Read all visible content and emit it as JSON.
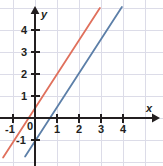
{
  "chart_data": {
    "type": "line",
    "title": "",
    "subtitle": "",
    "xlabel": "x",
    "ylabel": "y",
    "xlim": [
      -1.6,
      5.1
    ],
    "ylim": [
      -1.9,
      5.2
    ],
    "grid": true,
    "grid_step": 1,
    "legend_position": "none",
    "annotations": [],
    "axis_origin_label": "0",
    "xticks": [
      -1,
      0,
      1,
      2,
      3,
      4
    ],
    "xticklabels": [
      "-1",
      "0",
      "1",
      "2",
      "3",
      "4"
    ],
    "yticks": [
      -1,
      1,
      2,
      3,
      4
    ],
    "yticklabels": [
      "-1",
      "1",
      "2",
      "3",
      "4"
    ],
    "series": [
      {
        "name": "red-line",
        "color": "#e0705c",
        "slope": 1.55,
        "intercept": 0.45,
        "x_intercept": -0.29,
        "points": [
          [
            -1.45,
            -1.8
          ],
          [
            2.95,
            5.0
          ]
        ]
      },
      {
        "name": "blue-line",
        "color": "#5c7fa8",
        "slope": 1.55,
        "intercept": -1.05,
        "x_intercept": 0.68,
        "points": [
          [
            -0.45,
            -1.75
          ],
          [
            3.95,
            5.05
          ]
        ]
      }
    ]
  },
  "axes": {
    "x_axis_label": "x",
    "y_axis_label": "y",
    "origin_label": "0"
  },
  "ticks": {
    "x": [
      {
        "label": "-1",
        "value": -1
      },
      {
        "label": "1",
        "value": 1
      },
      {
        "label": "2",
        "value": 2
      },
      {
        "label": "3",
        "value": 3
      },
      {
        "label": "4",
        "value": 4
      }
    ],
    "y": [
      {
        "label": "4",
        "value": 4
      },
      {
        "label": "3",
        "value": 3
      },
      {
        "label": "2",
        "value": 2
      },
      {
        "label": "1",
        "value": 1
      },
      {
        "label": "-1",
        "value": -1
      }
    ]
  },
  "colors": {
    "grid": "#dcdce8",
    "axis": "#231f20",
    "text": "#231f20",
    "background": "#ffffff",
    "series_red": "#e0705c",
    "series_blue": "#5c7fa8"
  }
}
